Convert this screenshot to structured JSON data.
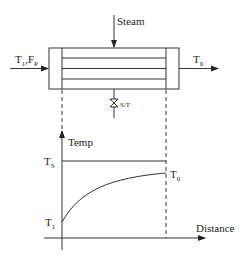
{
  "exchanger": {
    "steam_label": "Steam",
    "inlet_label_main": "T",
    "inlet_label_sub1": "1",
    "inlet_label_sep": ",F",
    "inlet_label_sub2": "P",
    "outlet_label_main": "T",
    "outlet_label_sub": "0",
    "trap_label": "S/T"
  },
  "graph": {
    "y_axis_label": "Temp",
    "x_axis_label": "Distance",
    "ts_label_main": "T",
    "ts_label_sub": "S",
    "t0_label_main": "T",
    "t0_label_sub": "0",
    "t1_label_main": "T",
    "t1_label_sub": "1"
  }
}
